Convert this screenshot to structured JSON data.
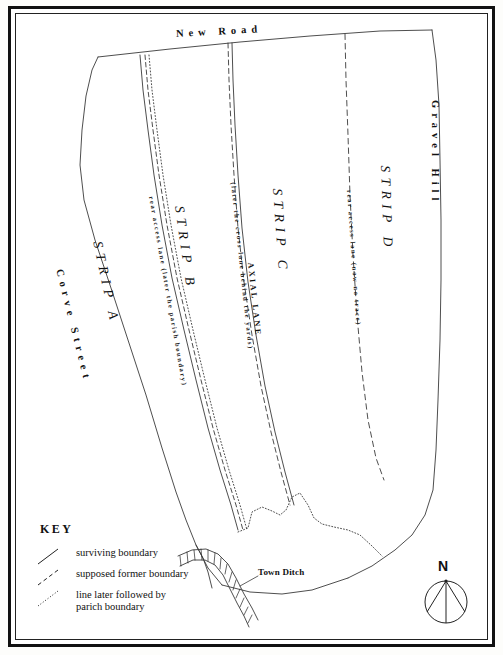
{
  "map": {
    "title": "Burgage strips plan",
    "roads": [
      {
        "id": "new-road",
        "label": "New   Road"
      },
      {
        "id": "gravel-hill",
        "label": "Gravel Hill"
      },
      {
        "id": "corve-street",
        "label": "Corve Street"
      }
    ],
    "strips": [
      {
        "id": "strip-a",
        "label": "STRIP A"
      },
      {
        "id": "strip-b",
        "label": "STRIP B"
      },
      {
        "id": "strip-c",
        "label": "STRIP C"
      },
      {
        "id": "strip-d",
        "label": "STRIP D"
      }
    ],
    "annotations": [
      {
        "id": "rear-access-parish",
        "label": "rear access lane (later the parish boundary)"
      },
      {
        "id": "cross-lane",
        "label": "(later the cross lane behind the yards)"
      },
      {
        "id": "axial-lane",
        "label": "AXIAL LANE"
      },
      {
        "id": "rear-access-notrace",
        "label": "rear access lane (now no trace)"
      },
      {
        "id": "town-ditch",
        "label": "Town Ditch"
      }
    ]
  },
  "key": {
    "title": "KEY",
    "entries": [
      {
        "id": "surviving-boundary",
        "style": "solid",
        "label": "surviving boundary"
      },
      {
        "id": "supposed-former-boundary",
        "style": "dashed",
        "label": "supposed former boundary"
      },
      {
        "id": "parish-boundary-line",
        "style": "dotted",
        "label": "line later followed by\nparich boundary"
      }
    ]
  },
  "compass": {
    "north_label": "N"
  },
  "colors": {
    "ink": "#111111",
    "paper": "#ffffff",
    "line": "#3a3a3a"
  }
}
